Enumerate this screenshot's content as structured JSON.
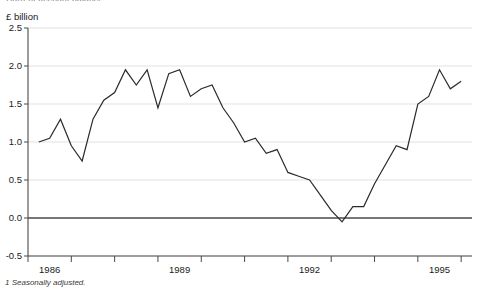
{
  "header": {
    "clipped_title": "Current account balance",
    "unit_label": "£ billion"
  },
  "footnote": {
    "text": "1 Seasonally adjusted."
  },
  "chart_data": {
    "type": "line",
    "title": "Current account balance",
    "subtitle": "",
    "xlabel": "",
    "ylabel": "£ billion",
    "ylim": [
      -0.5,
      2.5
    ],
    "xlim": [
      1985.5,
      1995.75
    ],
    "grid": true,
    "legend": null,
    "y_ticks": [
      "2.5",
      "2.0",
      "1.5",
      "1.0",
      "0.5",
      "0.0",
      "-0.5"
    ],
    "y_tick_values": [
      2.5,
      2.0,
      1.5,
      1.0,
      0.5,
      0.0,
      -0.5
    ],
    "x_ticks": [
      "1986",
      "1989",
      "1992",
      "1995"
    ],
    "x_tick_values": [
      1986,
      1989,
      1992,
      1995
    ],
    "x_minor_tick_values": [
      1985.5,
      1986.5,
      1987.5,
      1988.5,
      1989.5,
      1990.5,
      1991.5,
      1992.5,
      1993.5,
      1994.5,
      1995.5
    ],
    "zero_line": 0.0,
    "series": [
      {
        "name": "Current account balance",
        "x": [
          1985.75,
          1986.0,
          1986.25,
          1986.5,
          1986.75,
          1987.0,
          1987.25,
          1987.5,
          1987.75,
          1988.0,
          1988.25,
          1988.5,
          1988.75,
          1989.0,
          1989.25,
          1989.5,
          1989.75,
          1990.0,
          1990.25,
          1990.5,
          1990.75,
          1991.0,
          1991.25,
          1991.5,
          1991.75,
          1992.0,
          1992.25,
          1992.5,
          1992.75,
          1993.0,
          1993.25,
          1993.5,
          1993.75,
          1994.0,
          1994.25,
          1994.5,
          1994.75,
          1995.0,
          1995.25,
          1995.5
        ],
        "values": [
          1.0,
          1.05,
          1.3,
          0.95,
          0.75,
          1.3,
          1.55,
          1.65,
          1.95,
          1.75,
          1.95,
          1.45,
          1.9,
          1.95,
          1.6,
          1.7,
          1.75,
          1.45,
          1.25,
          1.0,
          1.05,
          0.85,
          0.9,
          0.6,
          0.55,
          0.5,
          0.3,
          0.1,
          -0.05,
          0.15,
          0.15,
          0.45,
          0.7,
          0.95,
          0.9,
          1.5,
          1.6,
          1.95,
          1.7,
          1.8
        ]
      }
    ]
  }
}
